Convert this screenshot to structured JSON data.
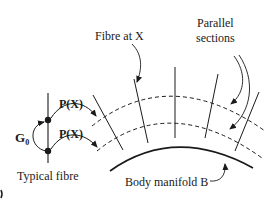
{
  "diagram": {
    "labels": {
      "fibre_at_x": "Fibre at X",
      "parallel_sections_line1": "Parallel",
      "parallel_sections_line2": "sections",
      "typical_fibre": "Typical fibre",
      "body_manifold": "Body manifold B",
      "g0_main": "G",
      "g0_sub": "0",
      "px_upper": "P(X)",
      "px_lower": "P(X)"
    },
    "colors": {
      "stroke": "#1a1a1a",
      "background": "#ffffff"
    }
  }
}
